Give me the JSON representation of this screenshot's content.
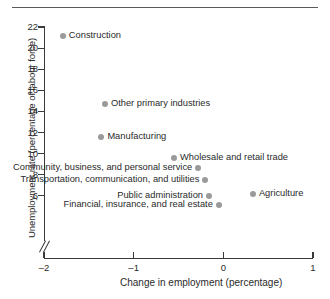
{
  "chart_data": {
    "type": "scatter",
    "title": "",
    "xlabel": "Change in employment (percentage)",
    "ylabel": "Unemployment rate (percentage of labour force)",
    "xlim": [
      -2,
      1
    ],
    "ylim": [
      5,
      22
    ],
    "y_axis_break": true,
    "grid": false,
    "legend": "none",
    "marker_color": "#9a9a9a",
    "axis_color": "#3a3a3a",
    "xticks": [
      "-2",
      "-1",
      "0",
      "1"
    ],
    "xtick_values": [
      -2,
      -1,
      0,
      1
    ],
    "yticks": [
      "22",
      "20",
      "18",
      "16",
      "14",
      "12",
      "10",
      "8",
      "6"
    ],
    "ytick_values": [
      22,
      20,
      18,
      16,
      14,
      12,
      10,
      8,
      6
    ],
    "points": [
      {
        "label": "Construction",
        "x": -1.79,
        "y": 21.1,
        "label_side": "right"
      },
      {
        "label": "Other primary industries",
        "x": -1.32,
        "y": 14.7,
        "label_side": "right"
      },
      {
        "label": "Manufacturing",
        "x": -1.36,
        "y": 11.6,
        "label_side": "right"
      },
      {
        "label": "Wholesale and retail trade",
        "x": -0.55,
        "y": 9.6,
        "label_side": "right"
      },
      {
        "label": "Community, business, and personal service",
        "x": -0.28,
        "y": 8.6,
        "label_side": "left"
      },
      {
        "label": "Transportation, communication, and utilities",
        "x": -0.2,
        "y": 7.5,
        "label_side": "left"
      },
      {
        "label": "Agriculture",
        "x": 0.33,
        "y": 6.2,
        "label_side": "right"
      },
      {
        "label": "Public administration",
        "x": -0.16,
        "y": 6.0,
        "label_side": "left"
      },
      {
        "label": "Financial, insurance, and real estate",
        "x": -0.05,
        "y": 5.1,
        "label_side": "left"
      }
    ]
  },
  "axes": {
    "x_title": "Change in employment (percentage)",
    "y_title": "Unemployment rate (percentage of labour force)"
  }
}
